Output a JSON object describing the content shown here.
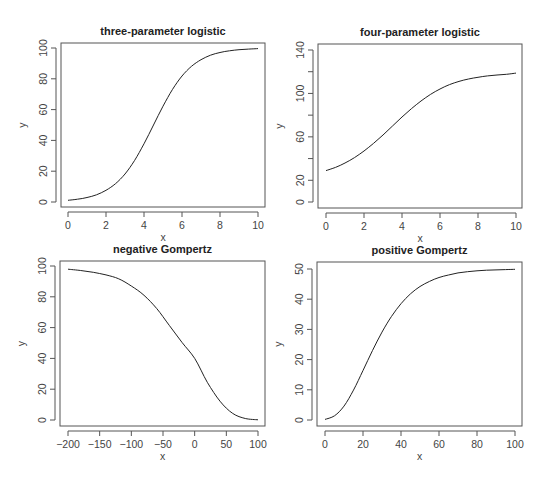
{
  "figure": {
    "layout": "2x2 grid of line plots",
    "line_color": "#222222",
    "axis_color": "#555555",
    "background": "#ffffff"
  },
  "chart_data": [
    {
      "type": "line",
      "title": "three-parameter logistic",
      "xlabel": "x",
      "ylabel": "y",
      "xlim": [
        0,
        10
      ],
      "ylim": [
        0,
        100
      ],
      "xticks": [
        0,
        2,
        4,
        6,
        8,
        10
      ],
      "xtick_labels": [
        "0",
        "2",
        "4",
        "6",
        "8",
        "10"
      ],
      "yticks": [
        0,
        20,
        40,
        60,
        80,
        100
      ],
      "ytick_labels": [
        "0",
        "20",
        "40",
        "60",
        "80",
        "100"
      ],
      "grid": false,
      "x": [
        0,
        0.5,
        1,
        1.5,
        2,
        2.5,
        3,
        3.5,
        4,
        4.5,
        5,
        5.5,
        6,
        6.5,
        7,
        7.5,
        8,
        8.5,
        9,
        9.5,
        10
      ],
      "y": [
        1.1,
        1.8,
        2.9,
        4.7,
        7.6,
        11.9,
        18.2,
        26.9,
        37.8,
        50.0,
        62.2,
        73.1,
        81.8,
        88.1,
        92.4,
        95.3,
        97.1,
        98.2,
        98.9,
        99.3,
        99.6
      ]
    },
    {
      "type": "line",
      "title": "four-parameter logistic",
      "xlabel": "x",
      "ylabel": "y",
      "xlim": [
        0,
        10
      ],
      "ylim": [
        0,
        140
      ],
      "xticks": [
        0,
        2,
        4,
        6,
        8,
        10
      ],
      "xtick_labels": [
        "0",
        "2",
        "4",
        "6",
        "8",
        "10"
      ],
      "yticks": [
        0,
        20,
        40,
        60,
        80,
        100,
        120,
        140
      ],
      "ytick_labels": [
        "0",
        "20",
        "",
        "60",
        "",
        "100",
        "",
        "140"
      ],
      "grid": false,
      "x": [
        0,
        0.5,
        1,
        1.5,
        2,
        2.5,
        3,
        3.5,
        4,
        4.5,
        5,
        5.5,
        6,
        6.5,
        7,
        7.5,
        8,
        8.5,
        9,
        9.5,
        10
      ],
      "y": [
        28.9,
        31.9,
        35.9,
        40.9,
        47.0,
        54.0,
        61.7,
        70.0,
        78.3,
        86.0,
        93.0,
        99.1,
        104.1,
        108.1,
        111.1,
        113.3,
        114.9,
        116.1,
        117.0,
        117.6,
        118.7
      ]
    },
    {
      "type": "line",
      "title": "negative Gompertz",
      "xlabel": "x",
      "ylabel": "y",
      "xlim": [
        -200,
        100
      ],
      "ylim": [
        0,
        100
      ],
      "xticks": [
        -200,
        -150,
        -100,
        -50,
        0,
        50,
        100
      ],
      "xtick_labels": [
        "−200",
        "−150",
        "−100",
        "−50",
        "0",
        "50",
        "100"
      ],
      "yticks": [
        0,
        20,
        40,
        60,
        80,
        100
      ],
      "ytick_labels": [
        "0",
        "20",
        "40",
        "60",
        "80",
        "100"
      ],
      "grid": false,
      "x": [
        -200,
        -180,
        -160,
        -140,
        -120,
        -100,
        -80,
        -60,
        -40,
        -20,
        0,
        20,
        40,
        60,
        80,
        100
      ],
      "y": [
        97.9,
        97.1,
        95.9,
        94.2,
        91.7,
        87.0,
        81.0,
        72.4,
        61.4,
        50.4,
        40.0,
        24.5,
        12.2,
        4.3,
        1.0,
        0.1
      ]
    },
    {
      "type": "line",
      "title": "positive Gompertz",
      "xlabel": "x",
      "ylabel": "y",
      "xlim": [
        0,
        100
      ],
      "ylim": [
        0,
        50
      ],
      "xticks": [
        0,
        20,
        40,
        60,
        80,
        100
      ],
      "xtick_labels": [
        "0",
        "20",
        "40",
        "60",
        "80",
        "100"
      ],
      "yticks": [
        0,
        10,
        20,
        30,
        40,
        50
      ],
      "ytick_labels": [
        "0",
        "10",
        "20",
        "30",
        "40",
        "50"
      ],
      "grid": false,
      "x": [
        0,
        5,
        10,
        15,
        20,
        25,
        30,
        35,
        40,
        45,
        50,
        55,
        60,
        65,
        70,
        75,
        80,
        85,
        90,
        95,
        100
      ],
      "y": [
        0.2,
        1.4,
        4.6,
        9.9,
        16.4,
        23.0,
        29.1,
        34.3,
        38.5,
        41.8,
        44.2,
        45.9,
        47.2,
        48.0,
        48.7,
        49.1,
        49.4,
        49.6,
        49.7,
        49.8,
        49.9
      ]
    }
  ]
}
